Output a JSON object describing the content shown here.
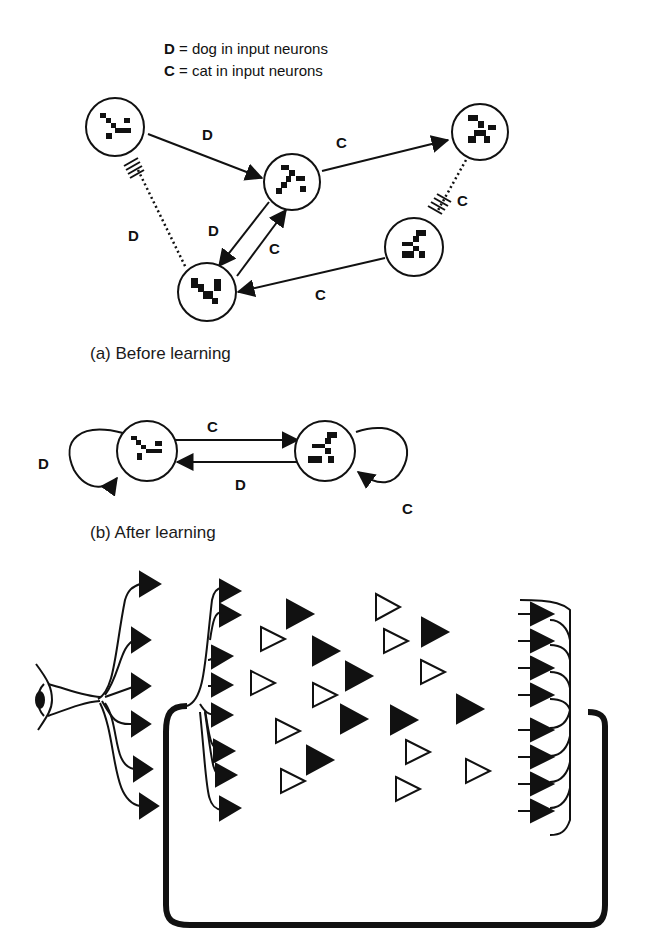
{
  "legend": {
    "line1_key": "D",
    "line1_text": " = dog in input neurons",
    "line2_key": "C",
    "line2_text": " = cat in input neurons"
  },
  "panel_a": {
    "caption": "(a) Before learning",
    "edge_labels": [
      "D",
      "C",
      "C",
      "D",
      "D",
      "C",
      "C"
    ]
  },
  "panel_b": {
    "caption": "(b) After learning",
    "edge_labels": [
      "C",
      "D",
      "D",
      "C"
    ]
  },
  "panel_c": {
    "description": "eye input projecting to layers of neurons (filled = active, hollow = inactive) with recurrent feedback loop"
  },
  "colors": {
    "ink": "#111111",
    "background": "#ffffff"
  }
}
